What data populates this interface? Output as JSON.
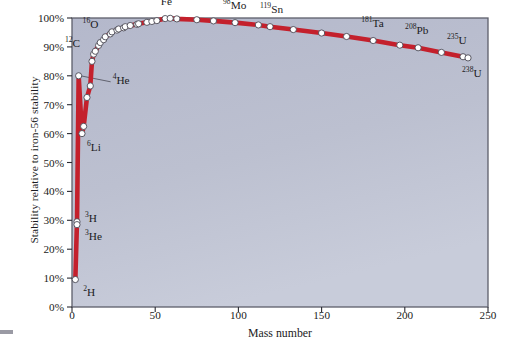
{
  "chart_data": {
    "type": "line",
    "title": "",
    "xlabel": "Mass number",
    "ylabel": "Stability relative to iron-56 stability",
    "xlim": [
      0,
      250
    ],
    "ylim": [
      0,
      1.0
    ],
    "grid": false,
    "legend": null,
    "marker": "open-circle",
    "line_color": "#c4202c",
    "marker_fill": "#ffffff",
    "plot_background": "#b9bdcf",
    "xticks": [
      0,
      50,
      100,
      150,
      200,
      250
    ],
    "xtick_labels": [
      "0",
      "50",
      "100",
      "150",
      "200",
      "250"
    ],
    "yticks": [
      0,
      0.1,
      0.2,
      0.3,
      0.4,
      0.5,
      0.6,
      0.7,
      0.8,
      0.9,
      1.0
    ],
    "ytick_labels": [
      "0%",
      "10%",
      "20%",
      "30%",
      "40%",
      "50%",
      "60%",
      "70%",
      "80%",
      "90%",
      "100%"
    ],
    "x": [
      2,
      3,
      3,
      4,
      6,
      7,
      9,
      11,
      12,
      13,
      14,
      16,
      17,
      19,
      20,
      23,
      24,
      27,
      28,
      31,
      32,
      35,
      39,
      40,
      45,
      48,
      51,
      56,
      59,
      63,
      75,
      85,
      98,
      112,
      119,
      133,
      150,
      165,
      181,
      197,
      208,
      222,
      235,
      238
    ],
    "y": [
      0.095,
      0.295,
      0.285,
      0.8,
      0.6,
      0.625,
      0.725,
      0.765,
      0.85,
      0.875,
      0.885,
      0.905,
      0.915,
      0.925,
      0.935,
      0.945,
      0.952,
      0.958,
      0.962,
      0.966,
      0.97,
      0.974,
      0.978,
      0.98,
      0.985,
      0.988,
      0.991,
      0.998,
      0.999,
      0.997,
      0.994,
      0.99,
      0.984,
      0.976,
      0.97,
      0.96,
      0.948,
      0.936,
      0.922,
      0.906,
      0.897,
      0.881,
      0.866,
      0.862
    ],
    "annotations": [
      {
        "text": "2H",
        "sup": "2",
        "base": "H",
        "x": 2,
        "y": 0.095,
        "dx": 8,
        "dy": 14,
        "leader": false
      },
      {
        "text": "3H",
        "sup": "3",
        "base": "H",
        "x": 3,
        "y": 0.295,
        "dx": 8,
        "dy": -2,
        "leader": false
      },
      {
        "text": "3He",
        "sup": "3",
        "base": "He",
        "x": 3,
        "y": 0.285,
        "dx": 8,
        "dy": 13,
        "leader": false
      },
      {
        "text": "4He",
        "sup": "4",
        "base": "He",
        "x": 4,
        "y": 0.8,
        "dx": 34,
        "dy": 6,
        "leader": true
      },
      {
        "text": "6Li",
        "sup": "6",
        "base": "Li",
        "x": 6,
        "y": 0.6,
        "dx": 5,
        "dy": 15,
        "leader": false
      },
      {
        "text": "12C",
        "sup": "12",
        "base": "C",
        "x": 12,
        "y": 0.85,
        "dx": -27,
        "dy": -16,
        "leader": false
      },
      {
        "text": "16O",
        "sup": "16",
        "base": "O",
        "x": 16,
        "y": 0.905,
        "dx": -16,
        "dy": -19,
        "leader": false
      },
      {
        "text": "56Fe",
        "sup": "56",
        "base": "Fe",
        "x": 56,
        "y": 0.998,
        "dx": -12,
        "dy": -16,
        "leader": false
      },
      {
        "text": "98Mo",
        "sup": "98",
        "base": "Mo",
        "x": 98,
        "y": 0.984,
        "dx": -12,
        "dy": -16,
        "leader": false
      },
      {
        "text": "119Sn",
        "sup": "119",
        "base": "Sn",
        "x": 119,
        "y": 0.97,
        "dx": -10,
        "dy": -16,
        "leader": false
      },
      {
        "text": "181Ta",
        "sup": "181",
        "base": "Ta",
        "x": 181,
        "y": 0.922,
        "dx": -12,
        "dy": -16,
        "leader": false
      },
      {
        "text": "208Pb",
        "sup": "208",
        "base": "Pb",
        "x": 208,
        "y": 0.897,
        "dx": -13,
        "dy": -16,
        "leader": false
      },
      {
        "text": "235U",
        "sup": "235",
        "base": "U",
        "x": 235,
        "y": 0.866,
        "dx": -16,
        "dy": -15,
        "leader": false
      },
      {
        "text": "238U",
        "sup": "238",
        "base": "U",
        "x": 238,
        "y": 0.862,
        "dx": -6,
        "dy": 17,
        "leader": false
      }
    ]
  }
}
